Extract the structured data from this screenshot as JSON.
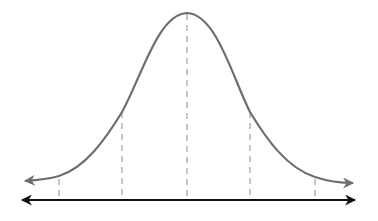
{
  "diagram": {
    "type": "normal-distribution-curve",
    "colors": {
      "curve": "#6e6e6e",
      "axis": "#111111",
      "dashed_lines": "#a8a8a8",
      "background": "#ffffff"
    },
    "dashed_markers": [
      {
        "position": "-2sd",
        "x": 59
      },
      {
        "position": "-1sd",
        "x": 122
      },
      {
        "position": "mean",
        "x": 187
      },
      {
        "position": "+1sd",
        "x": 250
      },
      {
        "position": "+2sd",
        "x": 315
      }
    ],
    "labels": []
  }
}
